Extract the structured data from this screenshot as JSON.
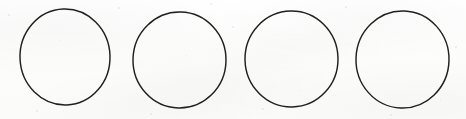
{
  "document": {
    "title": "Four hand-drawn circles",
    "kind": "scanned-line-drawing",
    "width": 466,
    "height": 119,
    "background_color": "#fdfdfc",
    "ink_color": "#221f1e",
    "stroke_width": 1.45,
    "text_content": "",
    "shape_count": 4
  },
  "shapes": [
    {
      "name": "circle-1",
      "label": "",
      "cx": 65.0,
      "cy": 57.0,
      "rx": 45.0,
      "ry": 48.0,
      "bbox": {
        "x": 20,
        "y": 9,
        "width": 90,
        "height": 96
      },
      "rotation": -2.0,
      "color": "#221f1e"
    },
    {
      "name": "circle-2",
      "label": "",
      "cx": 179.5,
      "cy": 60.0,
      "rx": 46.5,
      "ry": 48.0,
      "bbox": {
        "x": 133,
        "y": 12,
        "width": 93,
        "height": 96
      },
      "rotation": 1.5,
      "color": "#221f1e"
    },
    {
      "name": "circle-3",
      "label": "",
      "cx": 291.5,
      "cy": 59.0,
      "rx": 46.5,
      "ry": 48.0,
      "bbox": {
        "x": 245,
        "y": 11,
        "width": 93,
        "height": 96
      },
      "rotation": -1.0,
      "color": "#221f1e"
    },
    {
      "name": "circle-4",
      "label": "",
      "cx": 402.5,
      "cy": 59.5,
      "rx": 46.5,
      "ry": 48.5,
      "bbox": {
        "x": 356,
        "y": 11,
        "width": 93,
        "height": 97
      },
      "rotation": 2.0,
      "color": "#221f1e"
    }
  ],
  "specks": [
    {
      "x": 8,
      "y": 14,
      "size": 2
    },
    {
      "x": 118,
      "y": 7,
      "size": 2
    },
    {
      "x": 232,
      "y": 26,
      "size": 2
    },
    {
      "x": 345,
      "y": 6,
      "size": 2
    },
    {
      "x": 455,
      "y": 46,
      "size": 2
    },
    {
      "x": 36,
      "y": 110,
      "size": 2
    },
    {
      "x": 150,
      "y": 113,
      "size": 2
    },
    {
      "x": 262,
      "y": 108,
      "size": 2
    },
    {
      "x": 390,
      "y": 114,
      "size": 2
    },
    {
      "x": 210,
      "y": 3,
      "size": 2
    },
    {
      "x": 93,
      "y": 99,
      "size": 1
    },
    {
      "x": 300,
      "y": 90,
      "size": 1
    },
    {
      "x": 440,
      "y": 100,
      "size": 1
    },
    {
      "x": 186,
      "y": 55,
      "size": 1
    },
    {
      "x": 60,
      "y": 40,
      "size": 1
    }
  ]
}
